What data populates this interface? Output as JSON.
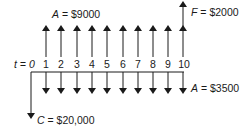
{
  "diagram": {
    "type": "cash-flow-diagram",
    "axis_label": "t = 0",
    "periods": [
      "1",
      "2",
      "3",
      "4",
      "5",
      "6",
      "7",
      "8",
      "9",
      "10"
    ],
    "labels": {
      "annual_income": {
        "symbol": "A",
        "value": "= $9000"
      },
      "future_value": {
        "symbol": "F",
        "value": "= $2000"
      },
      "annual_cost": {
        "symbol": "A",
        "value": "= $3500"
      },
      "initial_cost": {
        "symbol": "C",
        "value": "= $20,000"
      }
    },
    "flows": {
      "initial": {
        "period": 0,
        "direction": "down",
        "amount": 20000
      },
      "annual_up": {
        "periods": "1-10",
        "direction": "up",
        "amount": 9000
      },
      "annual_down": {
        "periods": "1-10",
        "direction": "down",
        "amount": 3500
      },
      "final_up": {
        "period": 10,
        "direction": "up",
        "amount": 2000
      }
    },
    "colors": {
      "ink": "#1a1a1a",
      "background": "#ffffff"
    }
  }
}
